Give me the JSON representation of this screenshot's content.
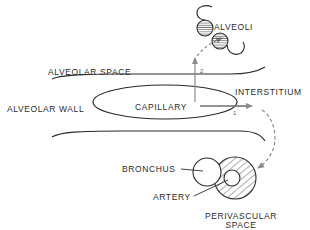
{
  "diagram": {
    "labels": {
      "alveoli": "ALVEOLI",
      "alveolar_space": "ALVEOLAR SPACE",
      "alveolar_wall": "ALVEOLAR WALL",
      "capillary": "CAPILLARY",
      "interstitium": "INTERSTITIUM",
      "bronchus": "BRONCHUS",
      "artery": "ARTERY",
      "perivascular_space_line1": "PERIVASCULAR",
      "perivascular_space_line2": "SPACE"
    },
    "pathways": [
      {
        "number": "1",
        "from": "CAPILLARY",
        "to": "INTERSTITIUM → PERIVASCULAR SPACE"
      },
      {
        "number": "2",
        "from": "CAPILLARY",
        "to": "ALVEOLAR SPACE → ALVEOLI"
      }
    ],
    "colors": {
      "line": "#2a2a2a",
      "arrow": "#8a8a8a",
      "background": "#ffffff"
    }
  }
}
